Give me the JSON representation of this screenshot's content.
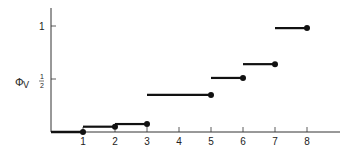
{
  "chart_data": {
    "type": "line",
    "subtype": "step",
    "title": "",
    "xlabel": "",
    "ylabel": "Φ_V",
    "ylabel_symbol": "Φ",
    "ylabel_sub": "V",
    "x_ticks": [
      1,
      2,
      3,
      4,
      5,
      6,
      7,
      8
    ],
    "x_tick_labels": [
      "1",
      "2",
      "3",
      "4",
      "5",
      "6",
      "7",
      "8"
    ],
    "y_ticks": [
      0.5,
      1
    ],
    "y_tick_labels": [
      "1/2",
      "1"
    ],
    "xlim": [
      0,
      9
    ],
    "ylim": [
      0,
      1.1
    ],
    "grid": false,
    "legend": null,
    "steps": [
      {
        "x_start": 0,
        "x_end": 1,
        "y": 0.0
      },
      {
        "x_start": 1,
        "x_end": 2,
        "y": 0.05
      },
      {
        "x_start": 2,
        "x_end": 3,
        "y": 0.075
      },
      {
        "x_start": 3,
        "x_end": 5,
        "y": 0.35
      },
      {
        "x_start": 5,
        "x_end": 6,
        "y": 0.51
      },
      {
        "x_start": 6,
        "x_end": 7,
        "y": 0.64
      },
      {
        "x_start": 7,
        "x_end": 8,
        "y": 0.98
      }
    ],
    "closed_endpoint": "right"
  },
  "labels": {
    "y_half_num": "1",
    "y_half_den": "2",
    "y_one": "1",
    "phi": "Φ",
    "phi_sub": "V"
  },
  "colors": {
    "line": "#111111",
    "axis": "#333333",
    "background": "#ffffff"
  }
}
